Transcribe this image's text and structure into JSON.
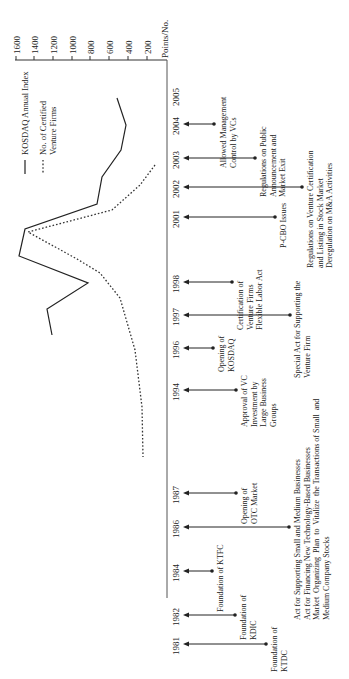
{
  "chart_data": {
    "type": "line",
    "orientation": "rotated-90-ccw (time runs top=2005 to bottom=1981, values increase leftward)",
    "title": "",
    "ylabel": "Points/No.",
    "ylim": [
      0,
      1600
    ],
    "yticks": [
      1600,
      1400,
      1200,
      1000,
      800,
      600,
      400,
      200
    ],
    "xlabel": "Year",
    "x": [
      1981,
      1982,
      1984,
      1986,
      1987,
      1994,
      1996,
      1997,
      1998,
      2001,
      2002,
      2003,
      2004,
      2005
    ],
    "legend": [
      "KOSDAQ Annual Index",
      "No. of Certified Venture Firms"
    ],
    "legend_position": "top-left",
    "grid": false,
    "series": [
      {
        "name": "KOSDAQ Annual Index",
        "style": "solid",
        "points": [
          {
            "year": 1996.0,
            "value": 1230
          },
          {
            "year": 1997.0,
            "value": 1270
          },
          {
            "year": 1998.0,
            "value": 840
          },
          {
            "year": 1999.0,
            "value": 1580
          },
          {
            "year": 2000.0,
            "value": 1520
          },
          {
            "year": 2001.0,
            "value": 740
          },
          {
            "year": 2002.0,
            "value": 690
          },
          {
            "year": 2003.0,
            "value": 490
          },
          {
            "year": 2004.0,
            "value": 440
          },
          {
            "year": 2005.0,
            "value": 520
          }
        ]
      },
      {
        "name": "No. of Certified Venture Firms",
        "style": "dotted",
        "points": [
          {
            "year": 1994.0,
            "value": 250
          },
          {
            "year": 1995.5,
            "value": 260
          },
          {
            "year": 1997.0,
            "value": 340
          },
          {
            "year": 1998.0,
            "value": 500
          },
          {
            "year": 1998.8,
            "value": 700
          },
          {
            "year": 1999.4,
            "value": 950
          },
          {
            "year": 2000.0,
            "value": 1480
          },
          {
            "year": 2001.0,
            "value": 590
          },
          {
            "year": 2002.0,
            "value": 290
          },
          {
            "year": 2003.0,
            "value": 130
          }
        ]
      }
    ],
    "timeline_events": [
      {
        "year": "2005",
        "text": ""
      },
      {
        "year": "2004",
        "text": "Allowed Management\nControl by VCs"
      },
      {
        "year": "2003",
        "text": "Regulations on Public\nAnnouncement and\nMarket Exit"
      },
      {
        "year": "2002",
        "text": "Regulations on Venture Certification\nand Listing in Stock Market\nDeregulation on M&A Activities"
      },
      {
        "year": "2001",
        "text": "P-CBO Issues"
      },
      {
        "year": "1998",
        "text": "Certification of\nVenture Firms\nFlexible Labor Act"
      },
      {
        "year": "1997",
        "text": "Special Act for Supporting the\nVenture Firm"
      },
      {
        "year": "1996",
        "text": "Opening of\nKOSDAQ"
      },
      {
        "year": "1994",
        "text": "Approval of VC\nInvestment by\nLarge Business\nGroups"
      },
      {
        "year": "1987",
        "text": "Opening of\nOTC Market"
      },
      {
        "year": "1986",
        "text": "Act for Supporting Small and Medium Businesses\nAct for Financing New Technology-Based Businesses\nMarket  Organizing  Plan  to  Vitalize  the Transactions of Small  and\nMedium Company Stocks"
      },
      {
        "year": "1984",
        "text": "Foundation of KTFC"
      },
      {
        "year": "1982",
        "text": "Foundation of\nKDIC"
      },
      {
        "year": "1981",
        "text": "Foundation of\nKTDC"
      }
    ]
  },
  "axis": {
    "ticks": [
      "1600",
      "1400",
      "1200",
      "1000",
      "800",
      "600",
      "400",
      "200"
    ],
    "unit_label": "Points/No."
  },
  "legend": {
    "kosdaq": "KOSDAQ Annual Index",
    "firms": "No. of Certified\nVenture Firms"
  },
  "timeline": [
    {
      "year": "2005",
      "y": 95,
      "end_x": null,
      "text": "",
      "text_x": 0,
      "text_y": 0
    },
    {
      "year": "2004",
      "y": 124,
      "end_x": 214,
      "text": "Allowed Management\nControl by VCs",
      "text_x": 223,
      "text_y": 168
    },
    {
      "year": "2003",
      "y": 158,
      "end_x": 255,
      "text": "Regulations on Public\nAnnouncement and\nMarket Exit",
      "text_x": 263,
      "text_y": 197
    },
    {
      "year": "2002",
      "y": 187,
      "end_x": 302,
      "text": "Regulations on Venture Certification\nand Listing in Stock Market\nDeregulation on M&A Activities",
      "text_x": 310,
      "text_y": 268
    },
    {
      "year": "2001",
      "y": 217,
      "end_x": 275,
      "text": "P-CBO Issues",
      "text_x": 283,
      "text_y": 248
    },
    {
      "year": "1998",
      "y": 282,
      "end_x": 232,
      "text": "Certification of\nVenture Firms\nFlexible Labor Act",
      "text_x": 240,
      "text_y": 330
    },
    {
      "year": "1997",
      "y": 315,
      "end_x": 290,
      "text": "Special Act for Supporting the\nVenture Firm",
      "text_x": 297,
      "text_y": 378
    },
    {
      "year": "1996",
      "y": 348,
      "end_x": 213,
      "text": "Opening of\nKOSDAQ",
      "text_x": 221,
      "text_y": 372
    },
    {
      "year": "1994",
      "y": 390,
      "end_x": 236,
      "text": "Approval of VC\nInvestment by\nLarge Business\nGroups",
      "text_x": 244,
      "text_y": 427
    },
    {
      "year": "1987",
      "y": 493,
      "end_x": 236,
      "text": "Opening of\nOTC Market",
      "text_x": 244,
      "text_y": 524
    },
    {
      "year": "1986",
      "y": 527,
      "end_x": 289,
      "text": "Act for Supporting Small and Medium Businesses\nAct for Financing New Technology-Based Businesses\nMarket  Organizing  Plan  to  Vitalize  the Transactions of Small  and\nMedium Company Stocks",
      "text_x": 297,
      "text_y": 620
    },
    {
      "year": "1984",
      "y": 571,
      "end_x": 212,
      "text": "Foundation of KTFC",
      "text_x": 220,
      "text_y": 612
    },
    {
      "year": "1982",
      "y": 615,
      "end_x": 235,
      "text": "Foundation of\nKDIC",
      "text_x": 243,
      "text_y": 640
    },
    {
      "year": "1981",
      "y": 644,
      "end_x": 266,
      "text": "Foundation of\nKTDC",
      "text_x": 274,
      "text_y": 672
    }
  ]
}
